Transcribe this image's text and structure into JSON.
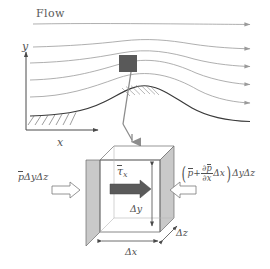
{
  "figure": {
    "background": "#ffffff"
  },
  "upper_scene": {
    "flow_label": "Flow",
    "y_axis_label": "y",
    "x_axis_label": "x",
    "streamline_count": 5,
    "streamline_color": "#9a9a9a",
    "terrain_color": "#3a3a3a",
    "marker_color": "#595959",
    "marker_name": "control-volume-marker"
  },
  "connector": {
    "leader_color": "#8c8c8c",
    "arrow_color": "#8c8c8c"
  },
  "control_volume": {
    "tau_label_text": "τ",
    "tau_subscript": "x",
    "left_pressure": {
      "p_symbol": "p",
      "suffix": "ΔyΔz"
    },
    "right_pressure": {
      "p_symbol": "p",
      "plus": "+",
      "numerator_partial": "∂",
      "numerator_p": "p",
      "denominator": "∂x",
      "delta_x": "Δx",
      "suffix": "ΔyΔz"
    },
    "dimensions": {
      "dy": "Δy",
      "dx": "Δx",
      "dz": "Δz"
    },
    "face_fill": "#c9c9c9",
    "edge_color": "#6b6b6b",
    "shear_arrow_color": "#5a5a5a",
    "pressure_arrow_outline": "#7a7a7a"
  }
}
